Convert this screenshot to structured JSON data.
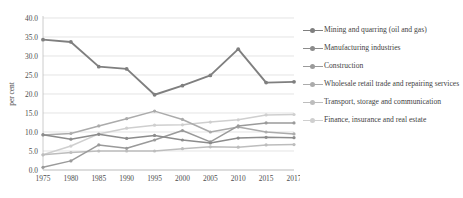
{
  "chart_data": {
    "type": "line",
    "title": "",
    "xlabel": "",
    "ylabel": "per cent",
    "ylim": [
      0,
      40
    ],
    "ytick_step": 5,
    "grid": true,
    "legend_position": "right",
    "categories": [
      "1975",
      "1980",
      "1985",
      "1990",
      "1995",
      "2000",
      "2005",
      "2010",
      "2015",
      "2017"
    ],
    "ytick_labels": [
      "0.0",
      "5.0",
      "10.0",
      "15.0",
      "20.0",
      "25.0",
      "30.0",
      "35.0",
      "40.0"
    ],
    "series": [
      {
        "name": "Mining and quarring (oil and gas)",
        "color": "#7f7f7f",
        "values": [
          34.3,
          33.7,
          27.2,
          26.6,
          19.8,
          22.2,
          24.9,
          31.8,
          23.0,
          23.2
        ]
      },
      {
        "name": "Manufacturing industries",
        "color": "#8c8c8c",
        "values": [
          9.3,
          8.1,
          9.4,
          8.3,
          9.1,
          7.9,
          7.1,
          8.4,
          8.6,
          8.5
        ]
      },
      {
        "name": "Construction",
        "color": "#9a9a9a",
        "values": [
          0.7,
          2.4,
          6.6,
          5.7,
          7.9,
          10.4,
          7.4,
          11.6,
          12.4,
          12.4
        ]
      },
      {
        "name": "Wholesale retail trade and repairing services",
        "color": "#ababab",
        "values": [
          9.2,
          9.6,
          11.6,
          13.5,
          15.5,
          13.3,
          10.0,
          11.3,
          10.0,
          9.5
        ]
      },
      {
        "name": "Transport, storage and communication",
        "color": "#bdbdbd",
        "values": [
          4.0,
          4.6,
          5.0,
          5.0,
          5.0,
          5.6,
          6.1,
          6.0,
          6.6,
          6.7
        ]
      },
      {
        "name": "Finance, insurance and real estate",
        "color": "#cfcfcf",
        "values": [
          4.0,
          6.3,
          9.5,
          11.0,
          11.8,
          11.9,
          12.6,
          13.2,
          14.5,
          14.6
        ]
      }
    ]
  },
  "legend": {
    "items": [
      {
        "label": "Mining and quarring (oil and gas)"
      },
      {
        "label": "Manufacturing industries"
      },
      {
        "label": "Construction"
      },
      {
        "label": "Wholesale retail trade and repairing services"
      },
      {
        "label": "Transport, storage and communication"
      },
      {
        "label": "Finance, insurance and real estate"
      }
    ]
  }
}
